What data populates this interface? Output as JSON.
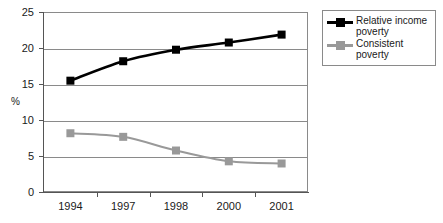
{
  "chart_data": {
    "type": "line",
    "title": "",
    "subtitle": "",
    "xlabel": "",
    "ylabel": "%",
    "categories": [
      "1994",
      "1997",
      "1998",
      "2000",
      "2001"
    ],
    "series": [
      {
        "name": "Relative income poverty",
        "values": [
          15.6,
          18.3,
          19.9,
          20.9,
          22.0
        ],
        "color": "#000000",
        "marker": "square"
      },
      {
        "name": "Consistent poverty",
        "values": [
          8.3,
          7.8,
          5.9,
          4.4,
          4.1
        ],
        "color": "#999999",
        "marker": "square"
      }
    ],
    "ylim": [
      0,
      25
    ],
    "yticks": [
      0,
      5,
      10,
      15,
      20,
      25
    ],
    "ytick_labels": [
      "0",
      "5",
      "10",
      "15",
      "20",
      "25"
    ],
    "grid": "horizontal",
    "legend_position": "right",
    "legend_entries": [
      {
        "label": "Relative income poverty",
        "color": "#000000"
      },
      {
        "label": "Consistent poverty",
        "color": "#999999"
      }
    ],
    "colors": {
      "axis": "#555555",
      "gridline": "#8a8a8a",
      "plot_border": "#8a8a8a",
      "text": "#1a1a1a",
      "background": "#ffffff"
    }
  }
}
